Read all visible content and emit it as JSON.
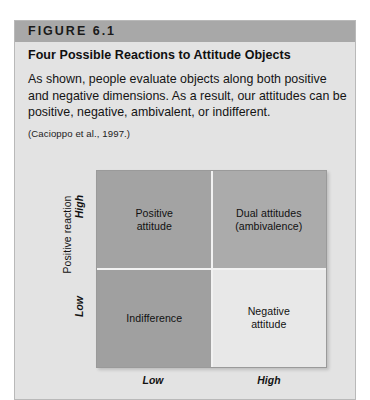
{
  "figure": {
    "header_label": "FIGURE 6.1",
    "title": "Four Possible Reactions to Attitude Objects",
    "body": "As shown, people evaluate objects along both positive and negative dimensions. As a result, our attitudes can be positive, negative, ambivalent, or indifferent.",
    "citation": "(Cacioppo et al., 1997.)"
  },
  "chart_data": {
    "type": "heatmap",
    "title": "Four Possible Reactions to Attitude Objects",
    "xlabel": "",
    "ylabel": "Positive reaction",
    "x_ticks": [
      "Low",
      "High"
    ],
    "y_ticks": [
      "High",
      "Low"
    ],
    "grid": false,
    "legend": "none",
    "cells": [
      {
        "row": "High",
        "col": "Low",
        "position": "top-left",
        "label": "Positive\nattitude",
        "color": "#a3a3a3"
      },
      {
        "row": "High",
        "col": "High",
        "position": "top-right",
        "label": "Dual attitudes\n(ambivalence)",
        "color": "#ababab"
      },
      {
        "row": "Low",
        "col": "Low",
        "position": "bottom-left",
        "label": "Indifference",
        "color": "#a0a0a0"
      },
      {
        "row": "Low",
        "col": "High",
        "position": "bottom-right",
        "label": "Negative\nattitude",
        "color": "#e8e8e8"
      }
    ]
  },
  "colors": {
    "panel_background": "#e3e3e3",
    "header_bar": "#a8a8a8",
    "divider": "#f2f2f2",
    "page_background": "#ffffff"
  }
}
